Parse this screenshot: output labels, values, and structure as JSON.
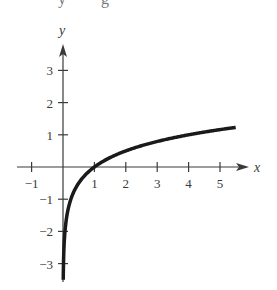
{
  "chart_data": {
    "type": "line",
    "title": "",
    "xlabel": "x",
    "ylabel": "y",
    "function": "y = log_4(x)",
    "xlim": [
      -1.3,
      5.8
    ],
    "ylim": [
      -3.5,
      3.8
    ],
    "x_ticks": [
      -1,
      1,
      2,
      3,
      4,
      5
    ],
    "x_tick_labels": [
      "−1",
      "1",
      "2",
      "3",
      "4",
      "5"
    ],
    "y_ticks": [
      3,
      2,
      1,
      -1,
      -2,
      -3
    ],
    "y_tick_labels": [
      "3",
      "2",
      "1",
      "−1",
      "−2",
      "−3"
    ],
    "grid": false,
    "legend": null,
    "series": [
      {
        "name": "log curve",
        "color": "#1a1a1a",
        "x": [
          0.008,
          0.016,
          0.03,
          0.0625,
          0.125,
          0.25,
          0.5,
          1,
          1.5,
          2,
          3,
          4,
          5,
          5.5
        ],
        "y": [
          -3.48,
          -2.98,
          -2.53,
          -2.0,
          -1.5,
          -1.0,
          -0.5,
          0,
          0.29,
          0.5,
          0.79,
          1.0,
          1.16,
          1.23
        ]
      }
    ],
    "top_fragments": [
      "y",
      "="
    ]
  },
  "colors": {
    "axis": "#3a3a3a",
    "curve": "#1a1a1a",
    "background": "#ffffff"
  }
}
